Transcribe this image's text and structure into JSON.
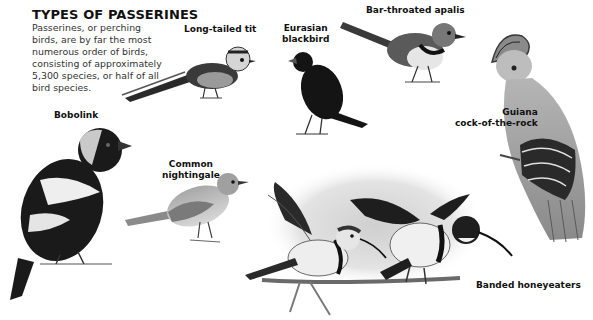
{
  "header": {
    "title": "TYPES OF PASSERINES",
    "intro": "Passerines, or perching birds, are by far the most numerous order of birds, consisting of approximately 5,300 species, or half of all bird species."
  },
  "birds": [
    {
      "id": "long-tailed-tit",
      "label": "Long-tailed tit"
    },
    {
      "id": "eurasian-blackbird",
      "label_line1": "Eurasian",
      "label_line2": "blackbird"
    },
    {
      "id": "bar-throated-apalis",
      "label": "Bar-throated apalis"
    },
    {
      "id": "guiana-cock-of-the-rock",
      "label_line1": "Guiana",
      "label_line2": "cock-of-the-rock"
    },
    {
      "id": "bobolink",
      "label": "Bobolink"
    },
    {
      "id": "common-nightingale",
      "label_line1": "Common",
      "label_line2": "nightingale"
    },
    {
      "id": "banded-honeyeaters",
      "label": "Banded honeyeaters"
    }
  ],
  "colors": {
    "background": "#ffffff",
    "text": "#111111",
    "body_text": "#333333",
    "ink_dark": "#1a1a1a",
    "mid_gray": "#8c8c8c",
    "light_gray": "#bdbdbd",
    "wash": "#d9d9d9"
  }
}
